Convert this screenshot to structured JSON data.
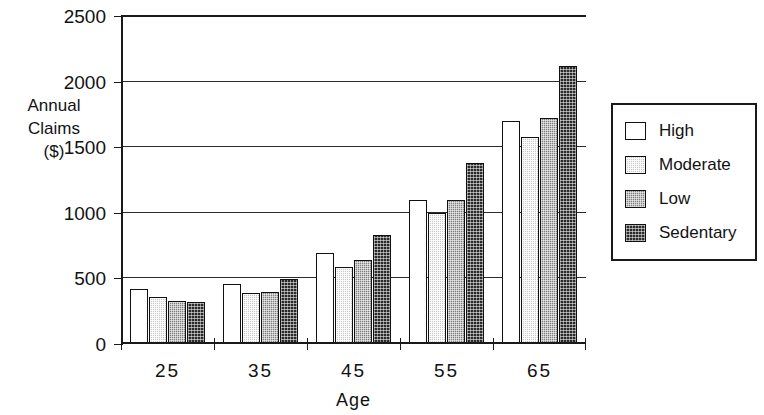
{
  "chart_data": {
    "type": "bar",
    "title": "",
    "xlabel": "Age",
    "ylabel": "Annual Claims ($)",
    "ylabel_lines": [
      "Annual",
      "Claims",
      "($)"
    ],
    "categories": [
      "25",
      "35",
      "45",
      "55",
      "65"
    ],
    "series": [
      {
        "name": "High",
        "color": "#ffffff",
        "pattern": "solid-white",
        "values": [
          420,
          460,
          690,
          1100,
          1700
        ]
      },
      {
        "name": "Moderate",
        "color": "#c9c9c9",
        "pattern": "light-stipple",
        "values": [
          360,
          390,
          590,
          1000,
          1580
        ]
      },
      {
        "name": "Low",
        "color": "#808080",
        "pattern": "medium-stipple",
        "values": [
          325,
          395,
          640,
          1100,
          1720
        ]
      },
      {
        "name": "Sedentary",
        "color": "#2a2a2a",
        "pattern": "dark-crosshatch",
        "values": [
          320,
          495,
          830,
          1380,
          2120
        ]
      }
    ],
    "ylim": [
      0,
      2500
    ],
    "yticks": [
      0,
      500,
      1000,
      1500,
      2000,
      2500
    ],
    "ytick_labels": [
      "0",
      "500",
      "1000",
      "1500",
      "2000",
      "2500"
    ],
    "grid": true,
    "grid_axis": "y",
    "legend_position": "right",
    "legend_entries": [
      "High",
      "Moderate",
      "Low",
      "Sedentary"
    ]
  }
}
